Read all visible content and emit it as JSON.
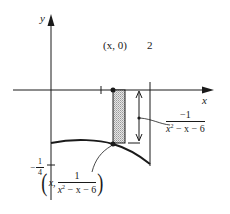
{
  "figure": {
    "axes": {
      "x_label": "x",
      "y_label": "y",
      "x_tick_label": "2",
      "y_tick_label": {
        "sign": "−",
        "num": "1",
        "den": "4"
      }
    },
    "point_top": {
      "label": "(x, 0)"
    },
    "height_label": {
      "num": "−1",
      "den_base": "x",
      "den_exp": "2",
      "den_rest": " − x − 6"
    },
    "point_bottom": {
      "open": "(",
      "x": "x,",
      "num": "1",
      "den_base": "x",
      "den_exp": "2",
      "den_rest": " − x − 6",
      "close": ")"
    },
    "colors": {
      "ink": "#1a1a1a",
      "shade": "#bdbdbd",
      "background": "#ffffff"
    }
  }
}
